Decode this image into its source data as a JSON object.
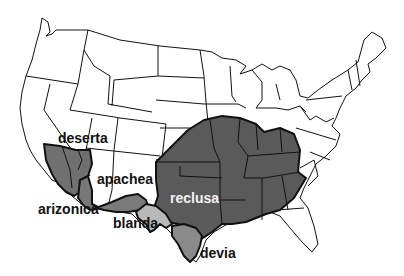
{
  "map": {
    "subject": "Distribution of Loxosceles (recluse spider) species in the United States",
    "colors": {
      "land": "#ffffff",
      "border": "#111111",
      "reclusa": "#5a5a5a",
      "deserta": "#707070",
      "arizonica": "#777777",
      "apachea": "#7a7a7a",
      "blanda": "#b8b8b8",
      "devia": "#8a8a8a"
    },
    "labels": {
      "deserta": "deserta",
      "apachea": "apachea",
      "arizonica": "arizonica",
      "blanda": "blanda",
      "reclusa": "reclusa",
      "devia": "devia"
    }
  }
}
